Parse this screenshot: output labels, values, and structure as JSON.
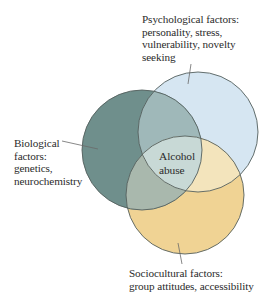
{
  "diagram": {
    "type": "venn",
    "center_label": [
      "Alcohol",
      "abuse"
    ],
    "sets": [
      {
        "id": "psychological",
        "title": "Psychological factors:",
        "lines": [
          "Psychological factors:",
          "personality, stress,",
          "vulnerability, novelty",
          "seeking"
        ],
        "color": "#d6e6f2",
        "circle": {
          "cx": 198,
          "cy": 132,
          "r": 60
        }
      },
      {
        "id": "biological",
        "title": "Biological factors:",
        "lines": [
          "Biological",
          "factors:",
          "genetics,",
          "neurochemistry"
        ],
        "color": "#6f8f8c",
        "circle": {
          "cx": 142,
          "cy": 150,
          "r": 60
        }
      },
      {
        "id": "sociocultural",
        "title": "Sociocultural factors:",
        "lines": [
          "Sociocultural factors:",
          "group attitudes, accessibility"
        ],
        "color": "#f0d394",
        "circle": {
          "cx": 185,
          "cy": 195,
          "r": 59
        }
      }
    ],
    "region_colors": {
      "bio_psych": "#9fb8b9",
      "bio_socio": "#a9b8ad",
      "psych_socio": "#f3e4bc",
      "all_three": "#c8d9d6"
    },
    "stroke_color": "#55605e"
  }
}
